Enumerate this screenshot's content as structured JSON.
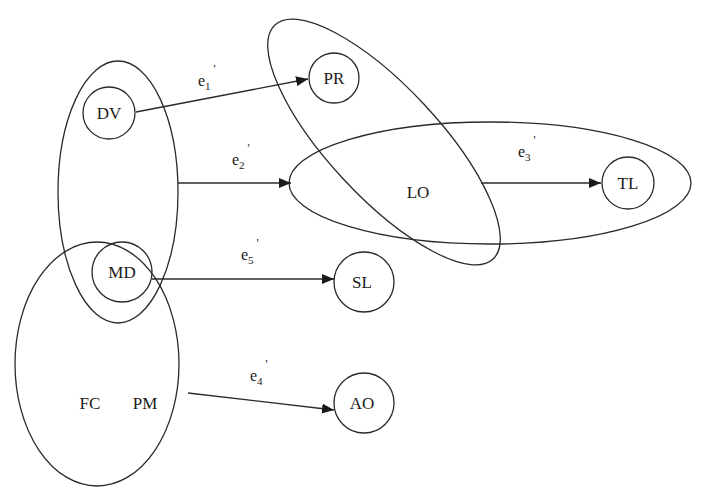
{
  "diagram": {
    "type": "hypergraph",
    "nodes": [
      {
        "id": "DV",
        "label": "DV",
        "circled": true
      },
      {
        "id": "MD",
        "label": "MD",
        "circled": true
      },
      {
        "id": "FC",
        "label": "FC",
        "circled": false
      },
      {
        "id": "PM",
        "label": "PM",
        "circled": false
      },
      {
        "id": "PR",
        "label": "PR",
        "circled": true
      },
      {
        "id": "LO",
        "label": "LO",
        "circled": false
      },
      {
        "id": "TL",
        "label": "TL",
        "circled": true
      },
      {
        "id": "SL",
        "label": "SL",
        "circled": true
      },
      {
        "id": "AO",
        "label": "AO",
        "circled": true
      }
    ],
    "groups": [
      {
        "id": "g_dv_md",
        "members": [
          "DV",
          "MD"
        ]
      },
      {
        "id": "g_md_fc_pm",
        "members": [
          "MD",
          "FC",
          "PM"
        ]
      },
      {
        "id": "g_pr_lo",
        "members": [
          "PR",
          "LO"
        ]
      },
      {
        "id": "g_lo_tl",
        "members": [
          "LO",
          "TL"
        ]
      }
    ],
    "edges": [
      {
        "id": "e1",
        "base": "e",
        "sub": "1",
        "prime": "'",
        "from": "DV",
        "to": "PR"
      },
      {
        "id": "e2",
        "base": "e",
        "sub": "2",
        "prime": "'",
        "from": "g_dv_md",
        "to": "g_lo_tl"
      },
      {
        "id": "e3",
        "base": "e",
        "sub": "3",
        "prime": "'",
        "from": "g_pr_lo",
        "to": "TL"
      },
      {
        "id": "e5",
        "base": "e",
        "sub": "5",
        "prime": "'",
        "from": "MD",
        "to": "SL"
      },
      {
        "id": "e4",
        "base": "e",
        "sub": "4",
        "prime": "'",
        "from": "g_md_fc_pm",
        "to": "AO"
      }
    ]
  },
  "labels": {
    "DV": "DV",
    "MD": "MD",
    "FC": "FC",
    "PM": "PM",
    "PR": "PR",
    "LO": "LO",
    "TL": "TL",
    "SL": "SL",
    "AO": "AO"
  },
  "edge_labels": {
    "e1": {
      "base": "e",
      "sub": "1",
      "prime": "'"
    },
    "e2": {
      "base": "e",
      "sub": "2",
      "prime": "'"
    },
    "e3": {
      "base": "e",
      "sub": "3",
      "prime": "'"
    },
    "e4": {
      "base": "e",
      "sub": "4",
      "prime": "'"
    },
    "e5": {
      "base": "e",
      "sub": "5",
      "prime": "'"
    }
  },
  "colors": {
    "stroke": "#2a2a2a",
    "background": "#ffffff"
  }
}
